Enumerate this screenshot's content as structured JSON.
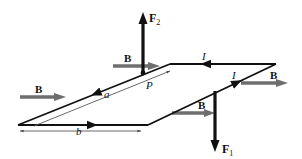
{
  "diagram": {
    "type": "rectangular current loop in uniform magnetic field",
    "colors": {
      "wire": "#111111",
      "field_arrow": "#6e6e6e",
      "force_arrow": "#111111",
      "dimension_line": "#444444",
      "background": "#ffffff"
    },
    "labels": {
      "force_top": "F",
      "force_top_sub": "2",
      "force_bottom": "F",
      "force_bottom_sub": "1",
      "field_1": "B",
      "field_2": "B",
      "field_3": "B",
      "field_4": "B",
      "current_top": "I",
      "current_right": "I",
      "point": "P",
      "side_a": "a",
      "side_b": "b"
    }
  }
}
